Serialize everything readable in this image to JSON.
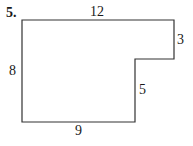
{
  "problem_number": "5.",
  "figure": {
    "type": "rectilinear-polygon",
    "stroke_color": "#333333",
    "vertices": [
      [
        22,
        20
      ],
      [
        174,
        20
      ],
      [
        174,
        59
      ],
      [
        135,
        59
      ],
      [
        135,
        122
      ],
      [
        22,
        122
      ]
    ],
    "side_labels": {
      "top": "12",
      "right_upper": "3",
      "left": "8",
      "inner_right": "5",
      "bottom": "9"
    }
  }
}
